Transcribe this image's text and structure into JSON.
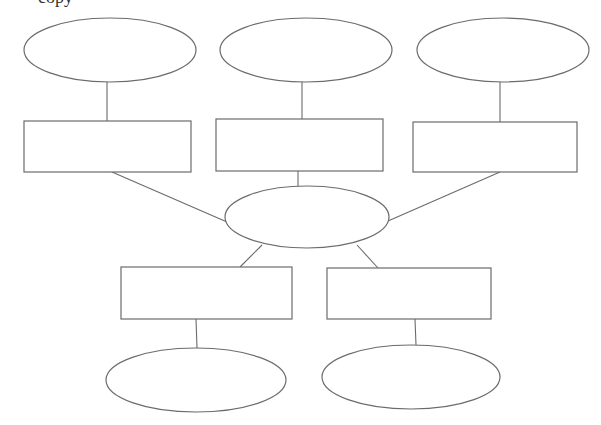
{
  "header": {
    "cropped_text": "copy"
  },
  "diagram": {
    "type": "graphic-organizer",
    "stroke_color": "#6b6b6b",
    "background": "#ffffff",
    "center": {
      "id": "center-ellipse",
      "shape": "ellipse",
      "label": "",
      "cx": 307,
      "cy": 217,
      "rx": 82,
      "ry": 31
    },
    "top_ellipses": [
      {
        "id": "top-ellipse-1",
        "label": "",
        "cx": 110,
        "cy": 50,
        "rx": 86,
        "ry": 32
      },
      {
        "id": "top-ellipse-2",
        "label": "",
        "cx": 306,
        "cy": 50,
        "rx": 86,
        "ry": 32
      },
      {
        "id": "top-ellipse-3",
        "label": "",
        "cx": 503,
        "cy": 50,
        "rx": 86,
        "ry": 32
      }
    ],
    "top_boxes": [
      {
        "id": "top-box-1",
        "label": "",
        "x": 24,
        "y": 121,
        "w": 167,
        "h": 51
      },
      {
        "id": "top-box-2",
        "label": "",
        "x": 216,
        "y": 119,
        "w": 167,
        "h": 52
      },
      {
        "id": "top-box-3",
        "label": "",
        "x": 413,
        "y": 122,
        "w": 164,
        "h": 50
      }
    ],
    "bottom_boxes": [
      {
        "id": "bottom-box-1",
        "label": "",
        "x": 121,
        "y": 267,
        "w": 171,
        "h": 52
      },
      {
        "id": "bottom-box-2",
        "label": "",
        "x": 327,
        "y": 268,
        "w": 164,
        "h": 51
      }
    ],
    "bottom_ellipses": [
      {
        "id": "bottom-ellipse-1",
        "label": "",
        "cx": 196,
        "cy": 380,
        "rx": 90,
        "ry": 32
      },
      {
        "id": "bottom-ellipse-2",
        "label": "",
        "cx": 411,
        "cy": 377,
        "rx": 89,
        "ry": 32
      }
    ],
    "connectors": [
      {
        "from": "top-ellipse-1",
        "to": "top-box-1",
        "x1": 107,
        "y1": 82,
        "x2": 107,
        "y2": 121
      },
      {
        "from": "top-ellipse-2",
        "to": "top-box-2",
        "x1": 302,
        "y1": 82,
        "x2": 302,
        "y2": 119
      },
      {
        "from": "top-ellipse-3",
        "to": "top-box-3",
        "x1": 500,
        "y1": 82,
        "x2": 500,
        "y2": 122
      },
      {
        "from": "top-box-1",
        "to": "center-ellipse",
        "x1": 112,
        "y1": 172,
        "x2": 227,
        "y2": 222
      },
      {
        "from": "top-box-2",
        "to": "center-ellipse",
        "x1": 298,
        "y1": 171,
        "x2": 298,
        "y2": 186
      },
      {
        "from": "top-box-3",
        "to": "center-ellipse",
        "x1": 500,
        "y1": 172,
        "x2": 388,
        "y2": 221
      },
      {
        "from": "center-ellipse",
        "to": "bottom-box-1",
        "x1": 262,
        "y1": 245,
        "x2": 240,
        "y2": 267
      },
      {
        "from": "center-ellipse",
        "to": "bottom-box-2",
        "x1": 357,
        "y1": 245,
        "x2": 378,
        "y2": 268
      },
      {
        "from": "bottom-box-1",
        "to": "bottom-ellipse-1",
        "x1": 196,
        "y1": 319,
        "x2": 197,
        "y2": 348
      },
      {
        "from": "bottom-box-2",
        "to": "bottom-ellipse-2",
        "x1": 415,
        "y1": 319,
        "x2": 416,
        "y2": 345
      }
    ]
  }
}
